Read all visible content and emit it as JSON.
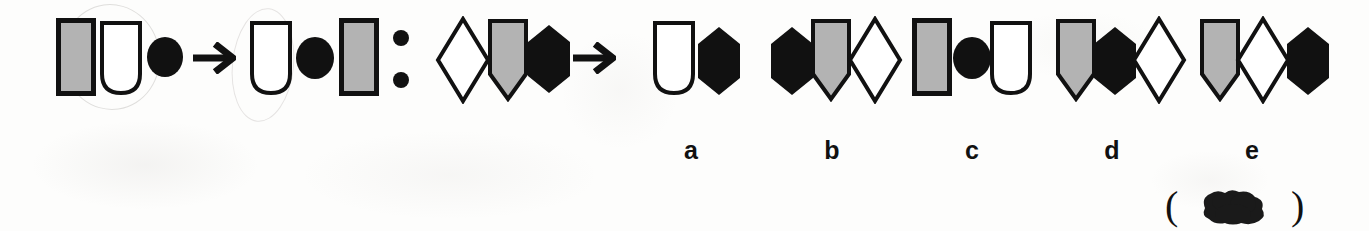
{
  "document": {
    "type": "visual-analogy-puzzle",
    "background_color": "#fdfdfc",
    "ink_color": "#111111",
    "fill_gray": "#b3b3b3",
    "fill_white": "#ffffff",
    "fill_black": "#111111"
  },
  "stem": {
    "relation_separator": ":",
    "pair_one": {
      "left_group": {
        "label": "rectangle-ushape-circle",
        "shapes": [
          {
            "name": "rectangle",
            "fill": "gray"
          },
          {
            "name": "u-shape",
            "fill": "white"
          },
          {
            "name": "circle",
            "fill": "black"
          }
        ]
      },
      "arrow": "→",
      "right_group": {
        "label": "ushape-circle-rectangle",
        "shapes": [
          {
            "name": "u-shape",
            "fill": "white"
          },
          {
            "name": "circle",
            "fill": "black"
          },
          {
            "name": "rectangle",
            "fill": "gray"
          }
        ]
      }
    },
    "pair_two": {
      "left_group": {
        "label": "diamond-shield-hexagon",
        "shapes": [
          {
            "name": "diamond",
            "fill": "white"
          },
          {
            "name": "shield",
            "fill": "gray"
          },
          {
            "name": "hexagon",
            "fill": "black"
          }
        ]
      },
      "arrow": "→",
      "right_group": {
        "label": "unknown-answer",
        "shapes": []
      }
    }
  },
  "options": [
    {
      "letter": "a",
      "shapes": [
        {
          "name": "u-shape",
          "fill": "white"
        },
        {
          "name": "hexagon",
          "fill": "black"
        }
      ]
    },
    {
      "letter": "b",
      "shapes": [
        {
          "name": "hexagon",
          "fill": "black"
        },
        {
          "name": "shield",
          "fill": "gray"
        },
        {
          "name": "diamond",
          "fill": "white"
        }
      ]
    },
    {
      "letter": "c",
      "shapes": [
        {
          "name": "rectangle",
          "fill": "gray"
        },
        {
          "name": "circle",
          "fill": "black"
        },
        {
          "name": "u-shape",
          "fill": "white"
        }
      ]
    },
    {
      "letter": "d",
      "shapes": [
        {
          "name": "shield",
          "fill": "gray"
        },
        {
          "name": "hexagon",
          "fill": "black"
        },
        {
          "name": "diamond",
          "fill": "white"
        }
      ]
    },
    {
      "letter": "e",
      "shapes": [
        {
          "name": "shield",
          "fill": "gray"
        },
        {
          "name": "diamond",
          "fill": "white"
        },
        {
          "name": "hexagon",
          "fill": "black"
        }
      ]
    }
  ],
  "answer_mark": {
    "paren_open": "(",
    "paren_close": ")",
    "content": "ink-blot"
  }
}
